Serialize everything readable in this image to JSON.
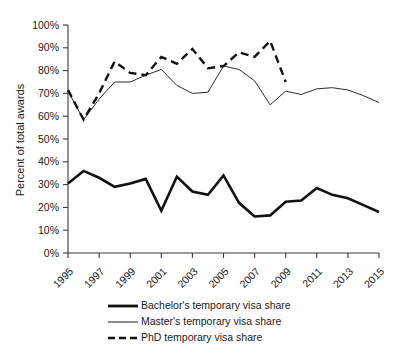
{
  "chart_data": {
    "type": "line",
    "title": "",
    "subtitle": "",
    "xlabel": "",
    "ylabel": "Percent of total awards",
    "ylim": [
      0,
      100
    ],
    "xlim": [
      1995,
      2015
    ],
    "grid": false,
    "legend_position": "bottom",
    "y_tick_labels": [
      "0%",
      "10%",
      "20%",
      "30%",
      "40%",
      "50%",
      "60%",
      "70%",
      "80%",
      "90%",
      "100%"
    ],
    "y_tick_values": [
      0,
      10,
      20,
      30,
      40,
      50,
      60,
      70,
      80,
      90,
      100
    ],
    "x_tick_labels": [
      "1995",
      "1997",
      "1999",
      "2001",
      "2003",
      "2005",
      "2007",
      "2009",
      "2011",
      "2013",
      "2015"
    ],
    "x_tick_values": [
      1995,
      1997,
      1999,
      2001,
      2003,
      2005,
      2007,
      2009,
      2011,
      2013,
      2015
    ],
    "x": [
      1995,
      1996,
      1997,
      1998,
      1999,
      2000,
      2001,
      2002,
      2003,
      2004,
      2005,
      2006,
      2007,
      2008,
      2009,
      2010,
      2011,
      2012,
      2013,
      2014,
      2015
    ],
    "series": [
      {
        "name": "Bachelor's temporary visa share",
        "style": "solid-thick",
        "color": "#111111",
        "width": 2.6,
        "dash": "none",
        "values": [
          30.5,
          36.0,
          33.0,
          29.0,
          30.5,
          32.5,
          18.5,
          33.5,
          27.0,
          25.5,
          34.0,
          22.0,
          16.0,
          16.5,
          22.5,
          23.0,
          28.5,
          25.5,
          24.0,
          21.0,
          18.0
        ]
      },
      {
        "name": "Master's temporary visa share",
        "style": "solid-thin",
        "color": "#2b2b2b",
        "width": 1.0,
        "dash": "none",
        "values": [
          71.0,
          58.5,
          67.5,
          75.0,
          75.0,
          78.0,
          80.5,
          73.5,
          70.0,
          70.5,
          82.0,
          80.5,
          75.5,
          65.0,
          71.0,
          69.5,
          72.0,
          72.5,
          71.5,
          69.0,
          66.0
        ]
      },
      {
        "name": "PhD temporary visa share",
        "style": "dashed",
        "color": "#111111",
        "width": 2.4,
        "dash": "8 5",
        "values": [
          71.5,
          58.5,
          70.0,
          84.0,
          79.0,
          78.0,
          86.0,
          83.0,
          89.5,
          81.0,
          82.0,
          88.0,
          86.0,
          93.0,
          75.0,
          null,
          null,
          null,
          null,
          null,
          null
        ]
      }
    ],
    "legend_entries": [
      {
        "label": "Bachelor's temporary visa share",
        "style": "solid-thick",
        "color": "#111111"
      },
      {
        "label": "Master's temporary visa share",
        "style": "solid-thin",
        "color": "#2b2b2b"
      },
      {
        "label": "PhD temporary visa share",
        "style": "dashed",
        "color": "#111111"
      }
    ]
  }
}
